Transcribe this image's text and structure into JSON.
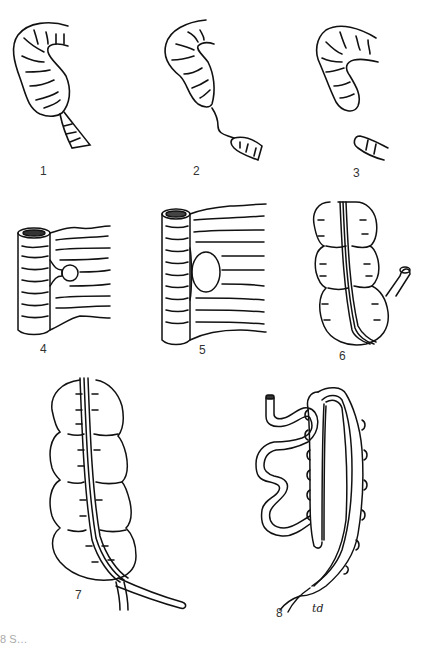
{
  "figure": {
    "panels": [
      {
        "id": 1,
        "label": "1",
        "subject": "colon-segment-narrowed-stricture"
      },
      {
        "id": 2,
        "label": "2",
        "subject": "colon-segment-thin-string-connection"
      },
      {
        "id": 3,
        "label": "3",
        "subject": "colon-segment-complete-separation"
      },
      {
        "id": 4,
        "label": "4",
        "subject": "bowel-with-mesentery-small-defect"
      },
      {
        "id": 5,
        "label": "5",
        "subject": "bowel-with-mesentery-large-defect"
      },
      {
        "id": 6,
        "label": "6",
        "subject": "cecum-with-appendix-taenia"
      },
      {
        "id": 7,
        "label": "7",
        "subject": "colon-haustra-with-taenia-and-appendix"
      },
      {
        "id": 8,
        "label": "8",
        "subject": "stomach-small-bowel-and-colon-loop"
      }
    ],
    "annotation": "td",
    "caption_partial": "8  S…"
  }
}
